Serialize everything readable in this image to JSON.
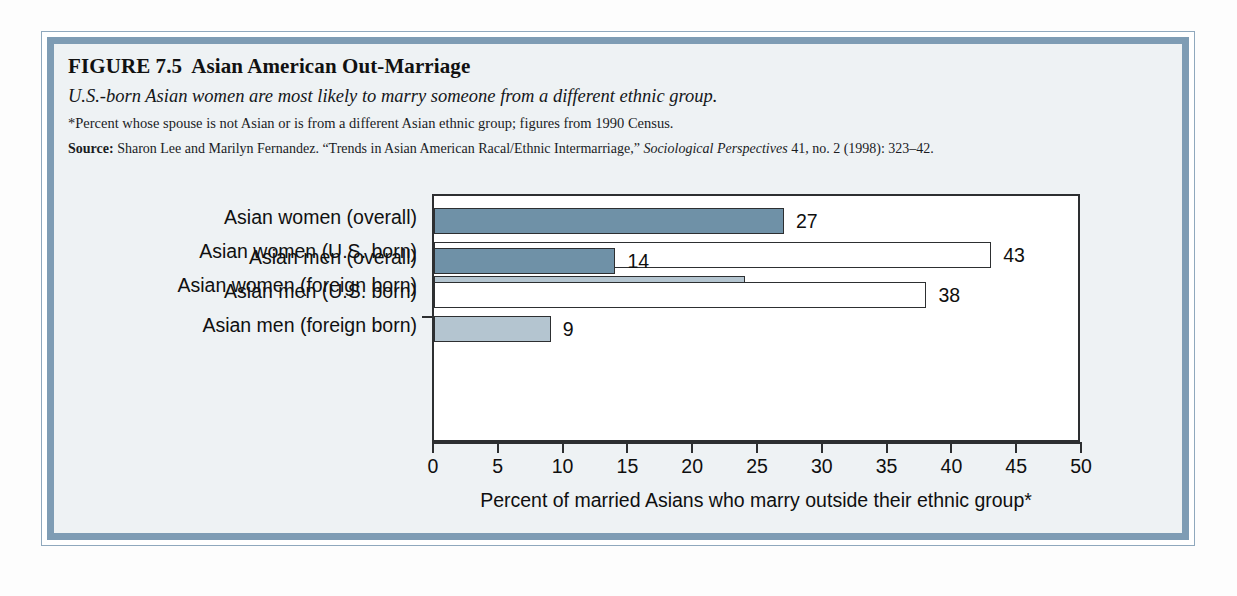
{
  "figure": {
    "number": "FIGURE 7.5",
    "title": "Asian American Out-Marriage",
    "subtitle": "U.S.-born Asian women are most likely to marry someone from a different ethnic group.",
    "footnote": "*Percent whose spouse is not Asian or is from a different Asian ethnic group; figures from 1990 Census.",
    "source_label": "Source:",
    "source_authors": "Sharon Lee and Marilyn Fernandez. “Trends in Asian American Racal/Ethnic Intermarriage,”",
    "source_journal": "Sociological Perspectives",
    "source_citation": "41, no. 2 (1998): 323–42."
  },
  "colors": {
    "bar_dark": "#6f91a7",
    "bar_light": "#b4c5d0",
    "bar_white": "#ffffff",
    "bar_stroke": "#2d2f31",
    "frame_band": "#7e9cb4",
    "frame_outline": "#8fa8bd",
    "page_background": "#eef2f4"
  },
  "chart_data": {
    "type": "bar",
    "orientation": "horizontal",
    "title": "Asian American Out-Marriage",
    "xlabel": "Percent of married Asians who marry outside their ethnic group*",
    "ylabel": "",
    "xlim": [
      0,
      50
    ],
    "xticks": [
      0,
      5,
      10,
      15,
      20,
      25,
      30,
      35,
      40,
      45,
      50
    ],
    "xtick_labels": [
      "0",
      "5",
      "10",
      "15",
      "20",
      "25",
      "30",
      "35",
      "40",
      "45",
      "50"
    ],
    "grid": false,
    "legend": false,
    "categories": [
      "Asian women (overall)",
      "Asian women (U.S. born)",
      "Asian women (foreign born)",
      "Asian men (overall)",
      "Asian men (U.S. born)",
      "Asian men (foreign born)"
    ],
    "values": [
      27,
      43,
      24,
      14,
      38,
      9
    ],
    "value_labels": [
      "27",
      "43",
      "24",
      "14",
      "38",
      "9"
    ],
    "bar_styles": [
      "dark",
      "white",
      "light",
      "dark",
      "white",
      "light"
    ],
    "groups": [
      {
        "name": "Asian women",
        "indices": [
          0,
          1,
          2
        ]
      },
      {
        "name": "Asian men",
        "indices": [
          3,
          4,
          5
        ]
      }
    ]
  }
}
